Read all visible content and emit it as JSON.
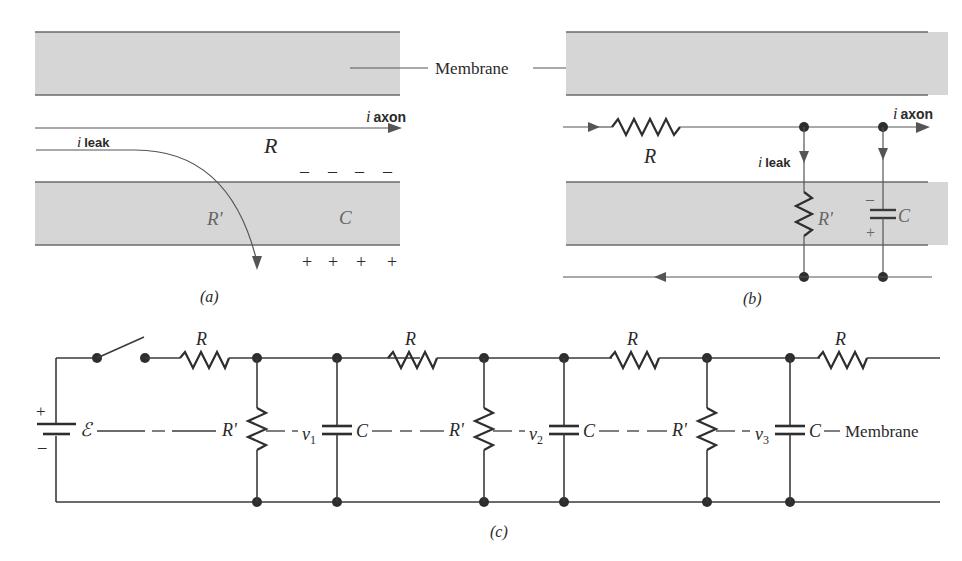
{
  "figure": {
    "panels": {
      "a": {
        "caption": "(a)",
        "membrane_label": "Membrane",
        "i_axon": {
          "i": "i",
          "sub": "axon"
        },
        "i_leak": {
          "i": "i",
          "sub": "leak"
        },
        "R": "R",
        "R_prime": "R'",
        "C": "C",
        "minus_signs": [
          "–",
          "–",
          "–",
          "–"
        ],
        "plus_signs": [
          "+",
          "+",
          "+",
          "+"
        ]
      },
      "b": {
        "caption": "(b)",
        "i_axon": {
          "i": "i",
          "sub": "axon"
        },
        "i_leak": {
          "i": "i",
          "sub": "leak"
        },
        "R": "R",
        "R_prime": "R'",
        "C": "C",
        "cap_minus": "–",
        "cap_plus": "+"
      },
      "c": {
        "caption": "(c)",
        "battery_plus": "+",
        "battery_minus": "–",
        "emf": "ℰ",
        "series_R": [
          "R",
          "R",
          "R",
          "R"
        ],
        "shunt_R": [
          "R'",
          "R'",
          "R'"
        ],
        "capacitors": [
          "C",
          "C",
          "C"
        ],
        "voltages": [
          {
            "v": "v",
            "sub": "1"
          },
          {
            "v": "v",
            "sub": "2"
          },
          {
            "v": "v",
            "sub": "3"
          }
        ],
        "membrane_label": "Membrane"
      }
    },
    "colors": {
      "membrane_fill": "#d6d6d6",
      "line": "#3a3a3a",
      "background": "#ffffff"
    }
  }
}
